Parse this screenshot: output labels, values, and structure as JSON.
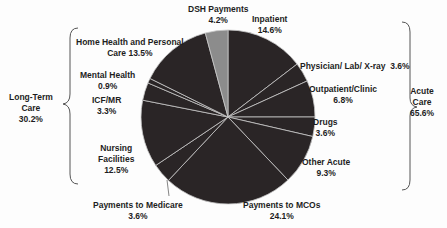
{
  "chart_data": {
    "type": "pie",
    "title": "",
    "start_angle_deg": 0,
    "direction": "clockwise",
    "slices": [
      {
        "label": "Inpatient",
        "value": 14.6,
        "group": "Acute Care",
        "color": "#2a2526"
      },
      {
        "label": "Physician/ Lab/ X-ray",
        "value": 3.6,
        "group": "Acute Care",
        "color": "#2a2526"
      },
      {
        "label": "Outpatient/Clinic",
        "value": 6.8,
        "group": "Acute Care",
        "color": "#2a2526"
      },
      {
        "label": "Drugs",
        "value": 3.6,
        "group": "Acute Care",
        "color": "#2a2526"
      },
      {
        "label": "Other Acute",
        "value": 9.3,
        "group": "Acute Care",
        "color": "#2a2526"
      },
      {
        "label": "Payments to MCOs",
        "value": 24.1,
        "group": "Acute Care",
        "color": "#2a2526"
      },
      {
        "label": "Payments to Medicare",
        "value": 3.6,
        "group": "Acute Care",
        "color": "#2a2526"
      },
      {
        "label": "Nursing Facilities",
        "value": 12.5,
        "group": "Long-Term Care",
        "color": "#2a2526"
      },
      {
        "label": "ICF/MR",
        "value": 3.3,
        "group": "Long-Term Care",
        "color": "#2a2526"
      },
      {
        "label": "Mental Health",
        "value": 0.9,
        "group": "Long-Term Care",
        "color": "#2a2526"
      },
      {
        "label": "Home Health and Personal Care",
        "value": 13.5,
        "group": "Long-Term Care",
        "color": "#2a2526"
      },
      {
        "label": "DSH Payments",
        "value": 4.2,
        "group": "DSH",
        "color": "#8c8c8c"
      }
    ],
    "groups": [
      {
        "label": "Acute Care",
        "value": 65.6
      },
      {
        "label": "Long-Term Care",
        "value": 30.2
      }
    ],
    "separator_color": "#c8c8c8",
    "legend": "none (direct labels)"
  },
  "labels": {
    "dsh": {
      "name": "DSH Payments",
      "pct": "4.2%"
    },
    "inpatient": {
      "name": "Inpatient",
      "pct": "14.6%"
    },
    "physician": {
      "name": "Physician/ Lab/ X-ray",
      "pct": "3.6%"
    },
    "outpatient": {
      "name": "Outpatient/Clinic",
      "pct": "6.8%"
    },
    "drugs": {
      "name": "Drugs",
      "pct": "3.6%"
    },
    "other_acute": {
      "name": "Other Acute",
      "pct": "9.3%"
    },
    "mcos": {
      "name": "Payments to MCOs",
      "pct": "24.1%"
    },
    "medicare": {
      "name": "Payments to Medicare",
      "pct": "3.6%"
    },
    "nursing": {
      "name1": "Nursing",
      "name2": "Facilities",
      "pct": "12.5%"
    },
    "icfmr": {
      "name": "ICF/MR",
      "pct": "3.3%"
    },
    "mental": {
      "name": "Mental Health",
      "pct": "0.9%"
    },
    "home": {
      "name": "Home Health and Personal",
      "name2": "Care 13.5%"
    },
    "acute_group": {
      "name1": "Acute",
      "name2": "Care",
      "pct": "65.6%"
    },
    "ltc_group": {
      "name1": "Long-Term",
      "name2": "Care",
      "pct": "30.2%"
    }
  }
}
